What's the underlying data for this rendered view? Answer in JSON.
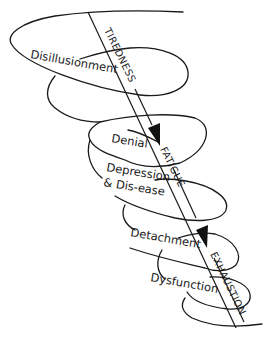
{
  "diagram": {
    "axis_labels": {
      "tiredness": "TIREDNESS",
      "fatigue": "FATIGUE",
      "exhaustion": "EXHAUSTION"
    },
    "stages": [
      {
        "label": "Disillusionment"
      },
      {
        "label": "Denial"
      },
      {
        "label": "Depression"
      },
      {
        "label": "& Dis-ease"
      },
      {
        "label": "Detachment"
      },
      {
        "label": "Dysfunction"
      }
    ],
    "colors": {
      "line": "#1a1a1a",
      "background": "#ffffff"
    }
  }
}
